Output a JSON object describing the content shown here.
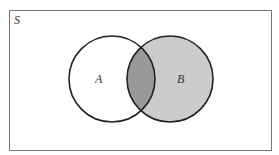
{
  "diagram": {
    "type": "venn",
    "universe_label": "S",
    "sets": [
      {
        "label": "A",
        "fill": "#ffffff"
      },
      {
        "label": "B",
        "fill": "#cccccc"
      }
    ],
    "intersection_fill": "#999999",
    "shaded_region": "B (including A ∩ B)",
    "colors": {
      "border": "#222222",
      "frame": "#666666"
    }
  }
}
